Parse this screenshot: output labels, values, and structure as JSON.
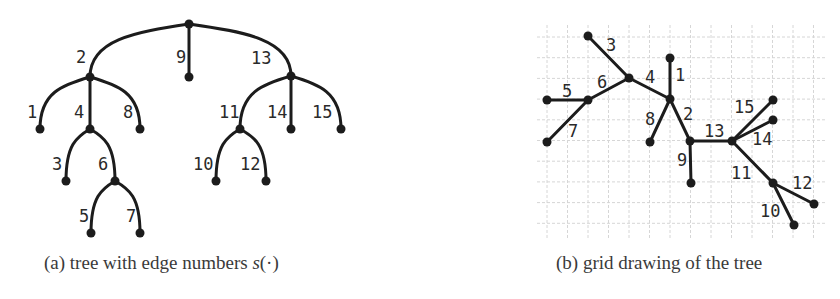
{
  "captions": {
    "a_prefix": "(a) tree with edge numbers ",
    "a_math": "s",
    "a_suffix": "(·)",
    "b": "(b) grid drawing of the tree"
  },
  "colors": {
    "ink": "#1c1c1c",
    "grid": "#d6d6d6",
    "caption": "#3a3a3a"
  },
  "tree_a": {
    "nodes": {
      "r": [
        189,
        24
      ],
      "n2": [
        90,
        77
      ],
      "l9": [
        189,
        77
      ],
      "n13": [
        291,
        76
      ],
      "l1": [
        40,
        129
      ],
      "n4": [
        90,
        129
      ],
      "l8": [
        140,
        129
      ],
      "n11": [
        240,
        129
      ],
      "l14": [
        291,
        129
      ],
      "l15": [
        341,
        129
      ],
      "l3": [
        66,
        181
      ],
      "n6": [
        115,
        181
      ],
      "l10": [
        216,
        181
      ],
      "l12": [
        266,
        181
      ],
      "l5": [
        91,
        233
      ],
      "l7": [
        140,
        233
      ]
    },
    "edges": [
      {
        "from": "r",
        "to": "n2",
        "label": "2",
        "lx": 76,
        "ly": 63
      },
      {
        "from": "r",
        "to": "l9",
        "label": "9",
        "lx": 176,
        "ly": 63
      },
      {
        "from": "r",
        "to": "n13",
        "label": "13",
        "lx": 251,
        "ly": 64
      },
      {
        "from": "n2",
        "to": "l1",
        "label": "1",
        "lx": 27,
        "ly": 118
      },
      {
        "from": "n2",
        "to": "n4",
        "label": "4",
        "lx": 74,
        "ly": 118
      },
      {
        "from": "n2",
        "to": "l8",
        "label": "8",
        "lx": 123,
        "ly": 118
      },
      {
        "from": "n4",
        "to": "l3",
        "label": "3",
        "lx": 52,
        "ly": 170
      },
      {
        "from": "n4",
        "to": "n6",
        "label": "6",
        "lx": 98,
        "ly": 170
      },
      {
        "from": "n6",
        "to": "l5",
        "label": "5",
        "lx": 79,
        "ly": 222
      },
      {
        "from": "n6",
        "to": "l7",
        "label": "7",
        "lx": 126,
        "ly": 222
      },
      {
        "from": "n13",
        "to": "n11",
        "label": "11",
        "lx": 219,
        "ly": 118
      },
      {
        "from": "n13",
        "to": "l14",
        "label": "14",
        "lx": 267,
        "ly": 118
      },
      {
        "from": "n13",
        "to": "l15",
        "label": "15",
        "lx": 312,
        "ly": 118
      },
      {
        "from": "n11",
        "to": "l10",
        "label": "10",
        "lx": 193,
        "ly": 170
      },
      {
        "from": "n11",
        "to": "l12",
        "label": "12",
        "lx": 240,
        "ly": 170
      }
    ]
  },
  "tree_b": {
    "grid": {
      "x0": 537,
      "x1": 825,
      "y0": 25,
      "y1": 240,
      "origin_x": 547,
      "origin_y": 37,
      "step_x": 20.5,
      "step_y": 20.7
    },
    "nodes": {
      "r": [
        690,
        141
      ],
      "n2": [
        670,
        99
      ],
      "l1": [
        670,
        58
      ],
      "n4": [
        629,
        78
      ],
      "l3": [
        588,
        36
      ],
      "n6": [
        588,
        100
      ],
      "l5": [
        547,
        100
      ],
      "l7": [
        547,
        142
      ],
      "l8": [
        650,
        142
      ],
      "l9": [
        691,
        183
      ],
      "n13": [
        732,
        141
      ],
      "l15": [
        773,
        100
      ],
      "l14": [
        773,
        120
      ],
      "n11": [
        773,
        183
      ],
      "l12": [
        814,
        204
      ],
      "l10": [
        794,
        225
      ]
    },
    "edges": [
      {
        "from": "n4",
        "to": "l3",
        "label": "3",
        "lx": 606,
        "ly": 51
      },
      {
        "from": "n2",
        "to": "l1",
        "label": "1",
        "lx": 675,
        "ly": 81
      },
      {
        "from": "n2",
        "to": "n4",
        "label": "4",
        "lx": 645,
        "ly": 83
      },
      {
        "from": "n4",
        "to": "n6",
        "label": "6",
        "lx": 597,
        "ly": 88
      },
      {
        "from": "n6",
        "to": "l5",
        "label": "5",
        "lx": 562,
        "ly": 97
      },
      {
        "from": "n6",
        "to": "l7",
        "label": "7",
        "lx": 568,
        "ly": 137
      },
      {
        "from": "n2",
        "to": "l8",
        "label": "8",
        "lx": 645,
        "ly": 125
      },
      {
        "from": "r",
        "to": "n2",
        "label": "2",
        "lx": 683,
        "ly": 120
      },
      {
        "from": "r",
        "to": "l9",
        "label": "9",
        "lx": 677,
        "ly": 166
      },
      {
        "from": "r",
        "to": "n13",
        "label": "13",
        "lx": 704,
        "ly": 137
      },
      {
        "from": "n13",
        "to": "l15",
        "label": "15",
        "lx": 734,
        "ly": 113
      },
      {
        "from": "n13",
        "to": "l14",
        "label": "14",
        "lx": 752,
        "ly": 145
      },
      {
        "from": "n13",
        "to": "n11",
        "label": "11",
        "lx": 731,
        "ly": 179
      },
      {
        "from": "n11",
        "to": "l12",
        "label": "12",
        "lx": 792,
        "ly": 189
      },
      {
        "from": "n11",
        "to": "l10",
        "label": "10",
        "lx": 760,
        "ly": 217
      }
    ]
  }
}
